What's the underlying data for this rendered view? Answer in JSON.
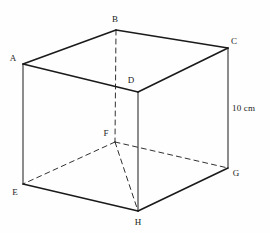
{
  "figure": {
    "kind": "cube-diagram",
    "title_text": "",
    "background_color": "#fefefe",
    "stroke_color": "#1a1a1a",
    "solid_stroke_width": 1.6,
    "thin_stroke_width": 1.0,
    "dashed_stroke_width": 0.9,
    "dash_pattern": "5,4",
    "vertices": [
      {
        "id": "A",
        "label": "A",
        "x": 23,
        "y": 64,
        "label_x": 13,
        "label_y": 58,
        "hidden": false
      },
      {
        "id": "B",
        "label": "B",
        "x": 116,
        "y": 30,
        "label_x": 115,
        "label_y": 19,
        "hidden": false
      },
      {
        "id": "C",
        "label": "C",
        "x": 228,
        "y": 48,
        "label_x": 234,
        "label_y": 41,
        "hidden": false
      },
      {
        "id": "D",
        "label": "D",
        "x": 138,
        "y": 92,
        "label_x": 131,
        "label_y": 80,
        "hidden": false
      },
      {
        "id": "E",
        "label": "E",
        "x": 23,
        "y": 184,
        "label_x": 15,
        "label_y": 192,
        "hidden": false
      },
      {
        "id": "F",
        "label": "F",
        "x": 115,
        "y": 142,
        "label_x": 106,
        "label_y": 133,
        "hidden": true
      },
      {
        "id": "G",
        "label": "G",
        "x": 228,
        "y": 168,
        "label_x": 236,
        "label_y": 173,
        "hidden": false
      },
      {
        "id": "H",
        "label": "H",
        "x": 138,
        "y": 211,
        "label_x": 138,
        "label_y": 222,
        "hidden": false
      }
    ],
    "edges": [
      {
        "from": "A",
        "to": "B",
        "style": "solid",
        "weight": "bold",
        "name": "edge-a-b"
      },
      {
        "from": "B",
        "to": "C",
        "style": "solid",
        "weight": "bold",
        "name": "edge-b-c"
      },
      {
        "from": "C",
        "to": "D",
        "style": "solid",
        "weight": "bold",
        "name": "edge-c-d"
      },
      {
        "from": "D",
        "to": "A",
        "style": "solid",
        "weight": "bold",
        "name": "edge-d-a"
      },
      {
        "from": "A",
        "to": "E",
        "style": "solid",
        "weight": "thin",
        "name": "edge-a-e"
      },
      {
        "from": "C",
        "to": "G",
        "style": "solid",
        "weight": "thin",
        "name": "edge-c-g"
      },
      {
        "from": "D",
        "to": "H",
        "style": "solid",
        "weight": "thin",
        "name": "edge-d-h"
      },
      {
        "from": "E",
        "to": "H",
        "style": "solid",
        "weight": "bold",
        "name": "edge-e-h"
      },
      {
        "from": "H",
        "to": "G",
        "style": "solid",
        "weight": "bold",
        "name": "edge-h-g"
      },
      {
        "from": "B",
        "to": "F",
        "style": "dashed",
        "weight": "dash",
        "name": "edge-b-f-hidden"
      },
      {
        "from": "F",
        "to": "E",
        "style": "dashed",
        "weight": "dash",
        "name": "edge-f-e-hidden"
      },
      {
        "from": "F",
        "to": "G",
        "style": "dashed",
        "weight": "dash",
        "name": "edge-f-g-hidden"
      },
      {
        "from": "F",
        "to": "H",
        "style": "dashed",
        "weight": "dash",
        "name": "edge-f-h-hidden"
      }
    ],
    "dimensions": [
      {
        "id": "height",
        "text": "10 cm",
        "label_x": 232,
        "label_y": 108,
        "measures_edge": "edge-c-g"
      }
    ]
  }
}
